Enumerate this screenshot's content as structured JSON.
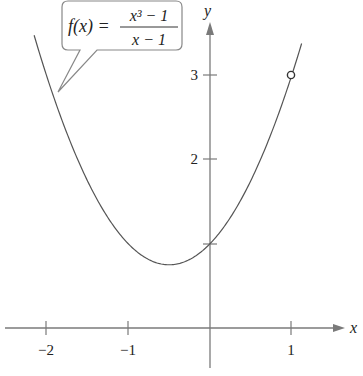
{
  "chart_data": {
    "type": "line",
    "title": "",
    "function_label": {
      "lhs": "f(x) =",
      "numerator": "x³ − 1",
      "denominator": "x − 1"
    },
    "xlabel": "x",
    "ylabel": "y",
    "x_ticks": [
      -2,
      -1,
      1
    ],
    "x_tick_labels": [
      "−2",
      "−1",
      "1"
    ],
    "y_ticks": [
      1,
      2,
      3
    ],
    "y_tick_labels": [
      "2",
      "3"
    ],
    "xlim": [
      -2.5,
      1.6
    ],
    "ylim": [
      -0.5,
      3.9
    ],
    "series": [
      {
        "name": "f(x) = (x^3 - 1)/(x - 1)",
        "equivalent": "x^2 + x + 1, x ≠ 1",
        "x": [
          -2.15,
          -2,
          -1.5,
          -1,
          -0.5,
          0,
          0.5,
          1,
          1.12
        ],
        "values": [
          3.47,
          3,
          1.75,
          1,
          0.75,
          1,
          1.75,
          3,
          3.37
        ]
      }
    ],
    "hole": {
      "x": 1,
      "y": 3,
      "style": "open-circle"
    },
    "grid": false,
    "legend": "none",
    "colors": {
      "curve": "#555555",
      "axis": "#777777",
      "text": "#222222"
    }
  }
}
